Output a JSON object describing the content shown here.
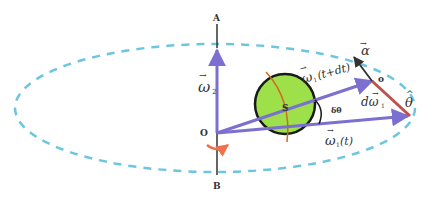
{
  "diagram": {
    "type": "physics-precession-diagram",
    "colors": {
      "orbit": "#6cc6df",
      "axis": "#7b6fd0",
      "vector": "#7b6fd0",
      "sphere_fill": "#9ee04a",
      "sphere_stroke": "#1a1a1a",
      "rotation_arrow": "#f07050",
      "alpha_arrow": "#333333",
      "d_omega": "#c0504d",
      "text": "#333333"
    },
    "labels": {
      "top_point": "A",
      "bottom_point": "B",
      "origin": "O",
      "origin_right": "o",
      "sphere": "S",
      "omega2": "ω",
      "omega2_sub": "2",
      "omega1_t_dt": "ω",
      "omega1_t_dt_suffix": "(t+dt)",
      "omega1_t": "ω",
      "omega1_t_suffix": "(t)",
      "omega_sub": "1",
      "delta_theta": "δθ",
      "d_omega": "dω",
      "d_omega_sub": "1",
      "alpha": "α",
      "theta_hat": "θ",
      "vector_bar": "→",
      "hat": "^"
    }
  }
}
